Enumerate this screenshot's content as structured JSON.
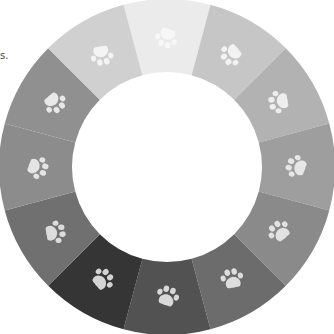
{
  "stray_text": "s.",
  "ring": {
    "center": [
      167,
      167
    ],
    "outer_radius": 168,
    "inner_radius": 95,
    "start_angle_deg": -15,
    "segments": [
      {
        "name": "segment-12",
        "color": "#ebebeb",
        "paw_color": "#f7f7f7"
      },
      {
        "name": "segment-1",
        "color": "#c6c6c6",
        "paw_color": "#f2f2f2"
      },
      {
        "name": "segment-2",
        "color": "#b2b2b2",
        "paw_color": "#eeeeee"
      },
      {
        "name": "segment-3",
        "color": "#9e9e9e",
        "paw_color": "#e6e6e6"
      },
      {
        "name": "segment-4",
        "color": "#8a8a8a",
        "paw_color": "#e2e2e2"
      },
      {
        "name": "segment-5",
        "color": "#6c6c6c",
        "paw_color": "#dddddd"
      },
      {
        "name": "segment-6",
        "color": "#525252",
        "paw_color": "#d8d8d8"
      },
      {
        "name": "segment-7",
        "color": "#353535",
        "paw_color": "#d4d4d4"
      },
      {
        "name": "segment-8",
        "color": "#707070",
        "paw_color": "#dcdcdc"
      },
      {
        "name": "segment-9",
        "color": "#8c8c8c",
        "paw_color": "#e4e4e4"
      },
      {
        "name": "segment-10",
        "color": "#909090",
        "paw_color": "#e8e8e8"
      },
      {
        "name": "segment-11",
        "color": "#d0d0d0",
        "paw_color": "#f4f4f4"
      }
    ]
  },
  "icon": "paw-print-icon"
}
